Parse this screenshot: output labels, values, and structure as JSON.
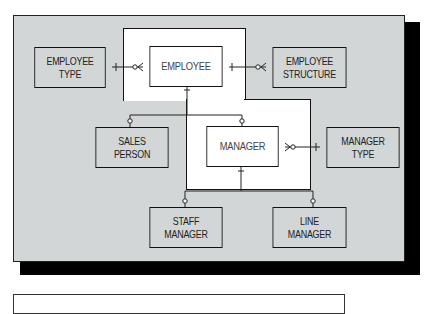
{
  "diagram": {
    "type": "entity-relationship",
    "colors": {
      "panel": "#d3d6d6",
      "supertype_region": "#ffffff",
      "border": "#111111",
      "shadow": "#000000"
    },
    "entities": {
      "employee": {
        "label": "EMPLOYEE"
      },
      "employee_type": {
        "label": "EMPLOYEE\nTYPE"
      },
      "employee_structure": {
        "label": "EMPLOYEE\nSTRUCTURE"
      },
      "sales_person": {
        "label": "SALES\nPERSON"
      },
      "manager": {
        "label": "MANAGER"
      },
      "manager_type": {
        "label": "MANAGER\nTYPE"
      },
      "staff_manager": {
        "label": "STAFF\nMANAGER"
      },
      "line_manager": {
        "label": "LINE\nMANAGER"
      }
    },
    "relationships": [
      {
        "from": "EMPLOYEE TYPE",
        "to": "EMPLOYEE",
        "from_end": "one",
        "to_end": "zero-or-many"
      },
      {
        "from": "EMPLOYEE",
        "to": "EMPLOYEE STRUCTURE",
        "from_end": "one",
        "to_end": "zero-or-many"
      },
      {
        "from": "EMPLOYEE",
        "to": "SALES PERSON",
        "from_end": "one",
        "to_end": "zero-or-one"
      },
      {
        "from": "EMPLOYEE",
        "to": "MANAGER",
        "from_end": "one",
        "to_end": "zero-or-one"
      },
      {
        "from": "MANAGER TYPE",
        "to": "MANAGER",
        "from_end": "one",
        "to_end": "zero-or-many"
      },
      {
        "from": "MANAGER",
        "to": "STAFF MANAGER",
        "from_end": "one",
        "to_end": "zero-or-one"
      },
      {
        "from": "MANAGER",
        "to": "LINE MANAGER",
        "from_end": "one",
        "to_end": "zero-or-one"
      }
    ]
  }
}
